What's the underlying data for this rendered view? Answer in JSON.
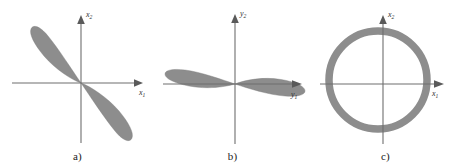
{
  "figure": {
    "title": "",
    "background_color": "#ffffff",
    "shape_color": "#8d8d8d",
    "axis_color": "#6e6e6e"
  },
  "panels": [
    {
      "id": "a",
      "caption": "a)",
      "axes": {
        "x_label_text": "x",
        "x_label_sub": "1",
        "y_label_text": "x",
        "y_label_sub": "2"
      },
      "shape": {
        "type": "two-lobe-bowtie",
        "orientation_degrees": 135,
        "description": "Two elongated petal lobes meeting at the origin along a negative-slope diagonal"
      }
    },
    {
      "id": "b",
      "caption": "b)",
      "axes": {
        "x_label_text": "y",
        "x_label_sub": "1",
        "y_label_text": "y",
        "y_label_sub": "2"
      },
      "shape": {
        "type": "two-lobe-bowtie",
        "orientation_degrees": 0,
        "description": "Two elongated petal lobes meeting at the origin along the horizontal axis"
      }
    },
    {
      "id": "c",
      "caption": "c)",
      "axes": {
        "x_label_text": "x",
        "x_label_sub": "1",
        "y_label_text": "x",
        "y_label_sub": "2"
      },
      "shape": {
        "type": "annulus-ring",
        "radius": 55,
        "thickness": 7.5,
        "description": "A thick circular ring (annulus) centred near the origin"
      }
    }
  ]
}
